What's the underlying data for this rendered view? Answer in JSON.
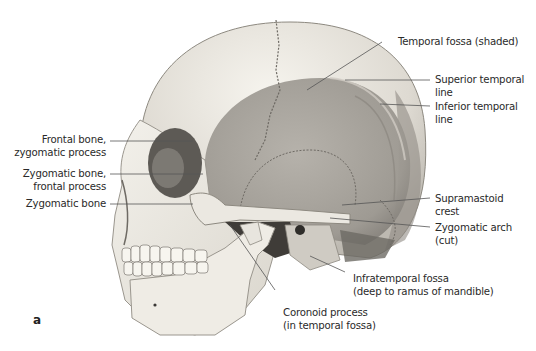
{
  "figure": {
    "panel_letter": "a",
    "colors": {
      "bone_light": "#f2f0ea",
      "bone_mid": "#dcd8cf",
      "temporal_fossa_shade": "#a8a49d",
      "dark_cavity": "#3a3835",
      "leader_line": "#555555",
      "text": "#2a2a2a"
    },
    "labels_left": [
      {
        "line1": "Frontal bone,",
        "line2": "zygomatic process"
      },
      {
        "line1": "Zygomatic bone,",
        "line2": "frontal process"
      },
      {
        "line1": "Zygomatic bone",
        "line2": ""
      }
    ],
    "labels_right": [
      {
        "line1": "Temporal fossa (shaded)",
        "line2": ""
      },
      {
        "line1": "Superior temporal",
        "line2": "line"
      },
      {
        "line1": "Inferior temporal",
        "line2": "line"
      },
      {
        "line1": "Supramastoid",
        "line2": "crest"
      },
      {
        "line1": "Zygomatic arch",
        "line2": "(cut)"
      }
    ],
    "labels_bottom": [
      {
        "line1": "Infratemporal fossa",
        "line2": "(deep to ramus of mandible)"
      },
      {
        "line1": "Coronoid process",
        "line2": "(in temporal fossa)"
      }
    ]
  }
}
